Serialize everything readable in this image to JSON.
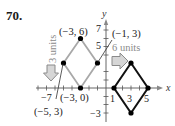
{
  "problem_number": "70.",
  "axes": {
    "x_label": "x",
    "y_label": "y"
  },
  "tick_labels": {
    "x": [
      "−7",
      "1",
      "3",
      "5"
    ],
    "y": [
      "7",
      "5",
      "−3"
    ]
  },
  "original_shape": {
    "color": "#a0a0a0",
    "vertices": [
      {
        "label": "(−3, 6)",
        "x": -3,
        "y": 6
      },
      {
        "label": "(−1, 3)",
        "x": -1,
        "y": 3
      },
      {
        "label": "(−3, 0)",
        "x": -3,
        "y": 0
      },
      {
        "label": "(−5, 3)",
        "x": -5,
        "y": 3
      }
    ]
  },
  "translated_shape": {
    "color": "#111111",
    "vertices": [
      {
        "x": 3,
        "y": 3
      },
      {
        "x": 5,
        "y": 0
      },
      {
        "x": 3,
        "y": -3
      },
      {
        "x": 1,
        "y": 0
      }
    ]
  },
  "annotations": {
    "down_shift": "3 units",
    "right_shift": "6 units"
  }
}
